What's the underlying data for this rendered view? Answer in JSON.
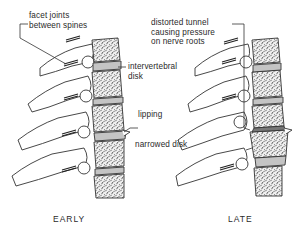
{
  "diagram": {
    "labels": {
      "facet_joints": [
        "facet joints",
        "between spines"
      ],
      "distorted_tunnel": [
        "distorted tunnel",
        "causing pressure",
        "on nerve roots"
      ],
      "intervertebral_disk": [
        "intervertebral",
        "disk"
      ],
      "lipping": "lipping",
      "narrowed_disk": "narrowed disk"
    },
    "captions": {
      "left": "EARLY",
      "right": "LATE"
    },
    "colors": {
      "line": "#333333",
      "background": "#ffffff",
      "bone_fill": "#f4f4f4",
      "disk_fill": "#bdbdbd"
    }
  }
}
